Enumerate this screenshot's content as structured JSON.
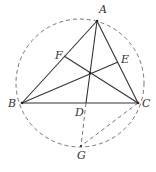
{
  "diagram": {
    "type": "geometry",
    "colors": {
      "line": "#333333",
      "dashed": "#666666",
      "background": "#ffffff"
    },
    "circle": {
      "cx": 80,
      "cy": 83,
      "r": 64,
      "style": "dashed"
    },
    "points": {
      "A": {
        "label": "A",
        "x": 97,
        "y": 21,
        "lx": 99,
        "ly": 13
      },
      "B": {
        "label": "B",
        "x": 22,
        "y": 103,
        "lx": 8,
        "ly": 107
      },
      "C": {
        "label": "C",
        "x": 138,
        "y": 103,
        "lx": 142,
        "ly": 107
      },
      "D": {
        "label": "D",
        "x": 86,
        "y": 103,
        "lx": 75,
        "ly": 116
      },
      "E": {
        "label": "E",
        "x": 118,
        "y": 62,
        "lx": 121,
        "ly": 63
      },
      "F": {
        "label": "F",
        "x": 64,
        "y": 56,
        "lx": 55,
        "ly": 59
      },
      "G": {
        "label": "G",
        "x": 81,
        "y": 146,
        "lx": 77,
        "ly": 159
      },
      "H": {
        "label": "",
        "x": 90,
        "y": 73
      }
    },
    "segments_solid": [
      "AB",
      "BC",
      "CA",
      "AD",
      "BE",
      "CF"
    ],
    "segments_dashed": [
      "DG",
      "CG"
    ]
  }
}
